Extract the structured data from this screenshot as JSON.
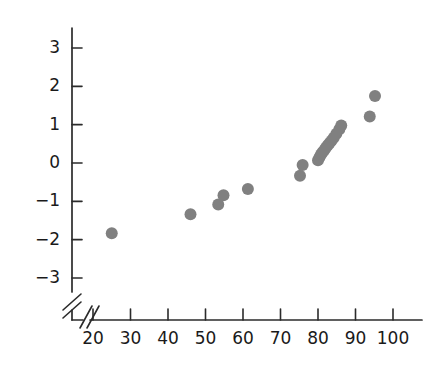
{
  "chart_data": {
    "type": "scatter",
    "title": "",
    "subtitle": "",
    "xlabel": "",
    "ylabel": "",
    "xlim": [
      17,
      104
    ],
    "ylim": [
      -3.6,
      3.4
    ],
    "xticks": [
      20,
      30,
      40,
      50,
      60,
      70,
      80,
      90,
      100
    ],
    "yticks": [
      3,
      2,
      1,
      0,
      -1,
      -2,
      -3
    ],
    "xtick_labels": [
      "20",
      "30",
      "40",
      "50",
      "60",
      "70",
      "80",
      "90",
      "100"
    ],
    "ytick_labels": [
      "3",
      "2",
      "1",
      "0",
      "−1",
      "−2",
      "−3"
    ],
    "grid": false,
    "legend": null,
    "legend_position": "none",
    "axis_breaks": {
      "x_axis_break": true,
      "y_axis_break": true,
      "note": "double slash break on x-axis before 20 and on y-axis below -3"
    },
    "marker": {
      "shape": "circle",
      "color": "#808080",
      "radius_px": 6,
      "opacity": 1
    },
    "points": [
      {
        "x": 25.0,
        "y": -1.83
      },
      {
        "x": 46.0,
        "y": -1.34
      },
      {
        "x": 53.4,
        "y": -1.08
      },
      {
        "x": 54.8,
        "y": -0.84
      },
      {
        "x": 61.3,
        "y": -0.68
      },
      {
        "x": 75.2,
        "y": -0.33
      },
      {
        "x": 75.9,
        "y": -0.05
      },
      {
        "x": 80.0,
        "y": 0.07
      },
      {
        "x": 80.4,
        "y": 0.15
      },
      {
        "x": 80.8,
        "y": 0.22
      },
      {
        "x": 81.2,
        "y": 0.28
      },
      {
        "x": 81.7,
        "y": 0.34
      },
      {
        "x": 82.1,
        "y": 0.4
      },
      {
        "x": 82.6,
        "y": 0.46
      },
      {
        "x": 83.1,
        "y": 0.52
      },
      {
        "x": 83.6,
        "y": 0.58
      },
      {
        "x": 84.2,
        "y": 0.66
      },
      {
        "x": 84.9,
        "y": 0.76
      },
      {
        "x": 85.7,
        "y": 0.88
      },
      {
        "x": 86.2,
        "y": 0.98
      },
      {
        "x": 93.8,
        "y": 1.21
      },
      {
        "x": 95.2,
        "y": 1.75
      }
    ]
  },
  "colors": {
    "marker": "#808080",
    "axis": "#2b2b2b",
    "text": "#1a1a1a",
    "background": "#ffffff"
  }
}
